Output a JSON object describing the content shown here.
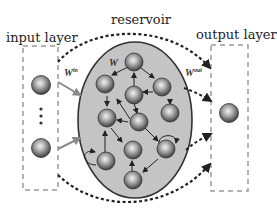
{
  "labels": {
    "input_layer": "input layer",
    "reservoir": "reservoir",
    "output_layer": "output layer",
    "w_in_base": "W",
    "w_in_sup": "in",
    "w_base": "W",
    "w_out_base": "W",
    "w_out_sup": "out",
    "ellipsis": "⋮"
  },
  "colors": {
    "reservoir_fill": "#c4c4c4",
    "reservoir_stroke": "#333333",
    "node_dark": "#4a4a4a",
    "node_light": "#f2f2f2",
    "dashed_box": "#9a9a9a",
    "dotted_arrow": "#222222",
    "input_arrow": "#8a8a8a"
  }
}
